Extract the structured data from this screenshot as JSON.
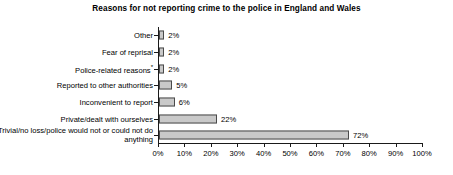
{
  "chart_data": {
    "type": "bar",
    "orientation": "horizontal",
    "title": "Reasons for not reporting crime to the police in England and Wales",
    "xlabel": "",
    "ylabel": "",
    "xlim": [
      0,
      100
    ],
    "grid": false,
    "legend": false,
    "categories": [
      "Other",
      "Fear of reprisal",
      "Police-related reasons*",
      "Reported to other authorities",
      "Inconvenient to report",
      "Private/dealt with ourselves",
      "Trivial/no loss/police would not or could not do anything"
    ],
    "values": [
      2,
      2,
      2,
      5,
      6,
      22,
      72
    ],
    "value_labels": [
      "2%",
      "2%",
      "2%",
      "5%",
      "6%",
      "22%",
      "72%"
    ],
    "xticks": [
      0,
      10,
      20,
      30,
      40,
      50,
      60,
      70,
      80,
      90,
      100
    ],
    "xtick_labels": [
      "0%",
      "10%",
      "20%",
      "30%",
      "40%",
      "50%",
      "60%",
      "70%",
      "80%",
      "90%",
      "100%"
    ],
    "colors": {
      "bar_fill": "#c9c9c9",
      "bar_border": "#4a4a4a",
      "axis": "#1a1a1a",
      "text": "#000000",
      "background": "#ffffff"
    }
  }
}
